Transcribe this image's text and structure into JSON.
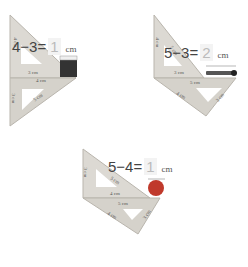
{
  "panels": [
    {
      "equation": {
        "a": "4",
        "op": "−",
        "b": "3",
        "eq": "=",
        "answer": "1",
        "unit": "cm"
      },
      "labels": {
        "side1": "4 cm",
        "hyp1": "5 cm",
        "base1": "3 cm",
        "side2": "3 cm",
        "base2": "4 cm",
        "hyp2": "5 cm"
      },
      "object": "eraser"
    },
    {
      "equation": {
        "a": "5",
        "op": "−",
        "b": "3",
        "eq": "=",
        "answer": "2",
        "unit": "cm"
      },
      "labels": {
        "side1": "4 cm",
        "hyp1": "5 cm",
        "base1": "3 cm",
        "base2": "5 cm",
        "side2": "4 cm",
        "hyp2": "3 cm"
      },
      "object": "match"
    },
    {
      "equation": {
        "a": "5",
        "op": "−",
        "b": "4",
        "eq": "=",
        "answer": "1",
        "unit": "cm"
      },
      "labels": {
        "side1": "3 cm",
        "hyp1": "5 cm",
        "base1": "4 cm",
        "base2": "5 cm",
        "side2": "4 cm",
        "hyp2": "3 cm"
      },
      "object": "ball"
    }
  ],
  "colors": {
    "triangle": "#d8d5cf",
    "triangle_edge": "#b9b5ad",
    "eraser": "#3a3a3a",
    "ball": "#c0392b",
    "match": "#444444"
  }
}
